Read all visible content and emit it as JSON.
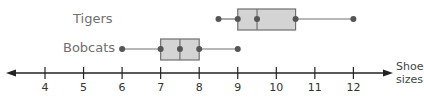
{
  "chart_data": {
    "type": "boxplot",
    "title": "",
    "xlabel": "Shoe sizes",
    "ylabel": "",
    "xlim": [
      3,
      13
    ],
    "x_ticks": [
      4,
      5,
      6,
      7,
      8,
      9,
      10,
      11,
      12
    ],
    "grid": false,
    "legend": null,
    "series": [
      {
        "name": "Tigers",
        "min": 8.5,
        "q1": 9,
        "median": 9.5,
        "q3": 10.5,
        "max": 12
      },
      {
        "name": "Bobcats",
        "min": 6,
        "q1": 7,
        "median": 7.5,
        "q3": 8,
        "max": 9
      }
    ]
  },
  "labels": {
    "tigers": "Tigers",
    "bobcats": "Bobcats",
    "axis_title_line1": "Shoe",
    "axis_title_line2": "sizes"
  },
  "ticks": [
    "4",
    "5",
    "6",
    "7",
    "8",
    "9",
    "10",
    "11",
    "12"
  ],
  "colors": {
    "box_fill": "#d4d4d4",
    "box_stroke": "#707070",
    "point": "#555555",
    "axis": "#222222",
    "label": "#6f6f6f"
  }
}
